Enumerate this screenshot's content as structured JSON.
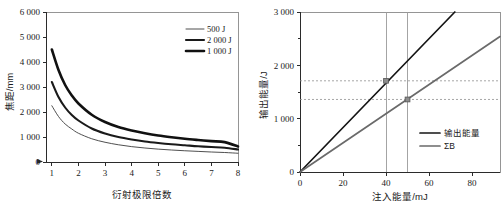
{
  "figure": {
    "panel_count": 2,
    "background_color": "#ffffff"
  },
  "chart_data": [
    {
      "id": "left-chart",
      "type": "line",
      "title": "",
      "xlabel": "衍射极限倍数",
      "ylabel": "焦距/mm",
      "xlim": [
        0.78,
        8.0
      ],
      "ylim": [
        0,
        6000
      ],
      "xticks": [
        1,
        2,
        3,
        4,
        5,
        6,
        7,
        8
      ],
      "xtick_labels": [
        "1",
        "2",
        "3",
        "4",
        "5",
        "6",
        "7",
        "8"
      ],
      "yticks": [
        0,
        1000,
        2000,
        3000,
        4000,
        5000,
        6000
      ],
      "ytick_labels": [
        "0",
        "1 000",
        "2 000",
        "3 000",
        "4 000",
        "5 000",
        "6 000"
      ],
      "grid": false,
      "legend_position": "top-right",
      "x": [
        1,
        1.25,
        1.5,
        1.75,
        2,
        2.5,
        3,
        3.5,
        4,
        4.5,
        5,
        5.5,
        6,
        6.5,
        7,
        7.5,
        8
      ],
      "series": [
        {
          "name": "500 J",
          "label": "500 J",
          "color": "#3b3b3b",
          "line_width": 0.9,
          "values": [
            2250,
            1820,
            1520,
            1320,
            1150,
            930,
            790,
            690,
            615,
            560,
            515,
            480,
            450,
            425,
            400,
            380,
            350
          ]
        },
        {
          "name": "2 000 J",
          "label": "2 000 J",
          "color": "#1a1a1a",
          "line_width": 2.1,
          "values": [
            3200,
            2600,
            2180,
            1880,
            1660,
            1340,
            1140,
            1000,
            900,
            820,
            760,
            710,
            670,
            630,
            600,
            570,
            500
          ]
        },
        {
          "name": "1 000 J",
          "label": "1 000 J",
          "color": "#111111",
          "line_width": 2.6,
          "values": [
            4500,
            3680,
            3080,
            2660,
            2340,
            1890,
            1600,
            1400,
            1260,
            1150,
            1060,
            990,
            930,
            880,
            835,
            795,
            620
          ]
        }
      ]
    },
    {
      "id": "right-chart",
      "type": "line",
      "title": "",
      "xlabel": "注入能量/mJ",
      "ylabel": "输出能量/J",
      "xlim": [
        0,
        93
      ],
      "ylim": [
        0,
        3000
      ],
      "xticks": [
        0,
        20,
        40,
        60,
        80
      ],
      "xtick_labels": [
        "0",
        "20",
        "40",
        "60",
        "80"
      ],
      "yticks": [
        0,
        1000,
        2000,
        3000
      ],
      "ytick_labels": [
        "0",
        "1 000",
        "2 000",
        "3 000"
      ],
      "grid": false,
      "legend_position": "bottom-right",
      "series": [
        {
          "name": "输出能量",
          "label": "输出能量",
          "color": "#141414",
          "line_width": 1.7,
          "x": [
            0,
            93
          ],
          "values": [
            0,
            3875
          ]
        },
        {
          "name": "ΣB",
          "label": "ΣB",
          "color": "#6a6a6a",
          "line_width": 1.7,
          "x": [
            0,
            93
          ],
          "values": [
            0,
            2540
          ]
        }
      ],
      "guide_lines_vertical": [
        {
          "x": 40,
          "color": "#9a9a9a"
        },
        {
          "x": 50,
          "color": "#9a9a9a"
        }
      ],
      "guide_lines_horizontal": [
        {
          "y": 1710,
          "color": "#8f8f8f",
          "dashed": true
        },
        {
          "y": 1360,
          "color": "#8f8f8f",
          "dashed": true
        }
      ],
      "markers": [
        {
          "x": 40,
          "y": 1710,
          "series": "输出能量",
          "color": "#8c8c8c"
        },
        {
          "x": 50,
          "y": 1360,
          "series": "ΣB",
          "color": "#8c8c8c"
        }
      ]
    }
  ]
}
